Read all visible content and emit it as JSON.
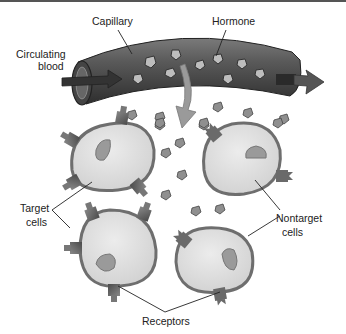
{
  "labels": {
    "capillary": "Capillary",
    "hormone": "Hormone",
    "circulating_blood_line1": "Circulating",
    "circulating_blood_line2": "blood",
    "target_cells_line1": "Target",
    "target_cells_line2": "cells",
    "nontarget_cells_line1": "Nontarget",
    "nontarget_cells_line2": "cells",
    "receptors": "Receptors"
  },
  "colors": {
    "vessel": "#5a5a5a",
    "vessel_dark": "#3a3a3a",
    "cell_fill": "#d9d9d9",
    "cell_membrane": "#7a7a7a",
    "nucleus": "#9a9a9a",
    "receptor": "#666666",
    "hormone": "#8a8a8a",
    "arrow": "#9a9a9a"
  }
}
